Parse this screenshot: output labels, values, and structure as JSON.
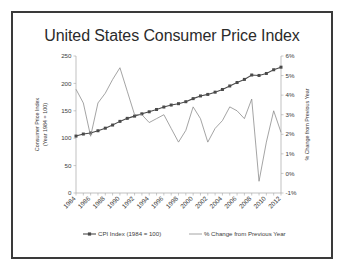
{
  "chart_data": {
    "type": "line",
    "title": "United States Consumer Price Index",
    "xlabel": "",
    "ylabel": "Consumer Price Index (Year 1984 = 100)",
    "y2label": "% Change from Previous Year",
    "grid": false,
    "legend_position": "bottom",
    "x": [
      1984,
      1985,
      1986,
      1987,
      1988,
      1989,
      1990,
      1991,
      1992,
      1993,
      1994,
      1995,
      1996,
      1997,
      1998,
      1999,
      2000,
      2001,
      2002,
      2003,
      2004,
      2005,
      2006,
      2007,
      2008,
      2009,
      2010,
      2011,
      2012
    ],
    "xtick_labels": [
      "1984",
      "1986",
      "1988",
      "1990",
      "1992",
      "1994",
      "1996",
      "1998",
      "2000",
      "2002",
      "2004",
      "2006",
      "2008",
      "2010",
      "2012"
    ],
    "ylim": [
      0,
      250
    ],
    "ytick_labels": [
      "0",
      "50",
      "100",
      "150",
      "200",
      "250"
    ],
    "ytick_values": [
      0,
      50,
      100,
      150,
      200,
      250
    ],
    "y2lim": [
      -1,
      6
    ],
    "y2tick_labels": [
      "-1%",
      "0%",
      "1%",
      "2%",
      "3%",
      "4%",
      "5%",
      "6%"
    ],
    "y2tick_values": [
      -1,
      0,
      1,
      2,
      3,
      4,
      5,
      6
    ],
    "series": [
      {
        "name": "CPI Index (1984 = 100)",
        "axis": "left",
        "color": "#4a4a4a",
        "marker": "square",
        "values": [
          103.9,
          107.6,
          109.6,
          113.6,
          118.3,
          124.0,
          130.7,
          136.2,
          140.3,
          144.5,
          148.2,
          152.4,
          156.9,
          160.5,
          163.0,
          166.6,
          172.2,
          177.1,
          179.9,
          184.0,
          188.9,
          195.3,
          201.6,
          207.3,
          215.3,
          214.5,
          218.1,
          224.9,
          229.6
        ]
      },
      {
        "name": "% Change from Previous Year",
        "axis": "right",
        "color": "#8d8d8d",
        "marker": "none",
        "values": [
          4.3,
          3.6,
          1.9,
          3.6,
          4.1,
          4.8,
          5.4,
          4.2,
          3.0,
          3.0,
          2.6,
          2.8,
          3.0,
          2.3,
          1.6,
          2.2,
          3.4,
          2.8,
          1.6,
          2.3,
          2.7,
          3.4,
          3.2,
          2.8,
          3.8,
          -0.4,
          1.6,
          3.2,
          2.1
        ]
      }
    ]
  },
  "legend": {
    "items": [
      {
        "label": "CPI Index (1984 = 100)"
      },
      {
        "label": "% Change from Previous Year"
      }
    ]
  }
}
